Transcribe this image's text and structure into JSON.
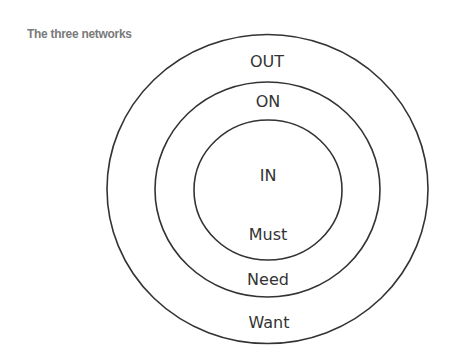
{
  "title": "The three networks",
  "diagram": {
    "type": "concentric-circles",
    "stroke_color": "#333333",
    "text_color": "#333333",
    "rings": [
      {
        "name": "outer",
        "network_label": "OUT",
        "category_label": "Want"
      },
      {
        "name": "middle",
        "network_label": "ON",
        "category_label": "Need"
      },
      {
        "name": "inner",
        "network_label": "IN",
        "category_label": "Must"
      }
    ],
    "labels": {
      "out": "OUT",
      "on": "ON",
      "in": "IN",
      "must": "Must",
      "need": "Need",
      "want": "Want"
    }
  }
}
